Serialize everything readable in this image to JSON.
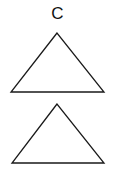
{
  "figure": {
    "label": "C",
    "stroke_color": "#1a1a1a",
    "shapes": [
      {
        "type": "triangle",
        "name": "top-triangle",
        "points": "57,33 11,92 104,92"
      },
      {
        "type": "triangle",
        "name": "bottom-triangle",
        "points": "57,104 12,163 104,163"
      }
    ]
  }
}
